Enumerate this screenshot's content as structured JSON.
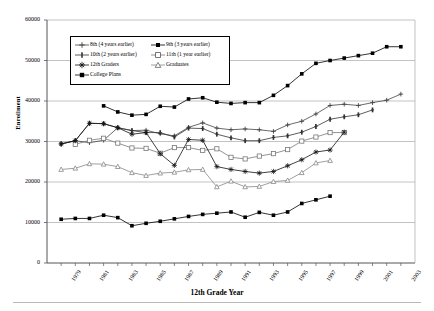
{
  "chart_data": {
    "type": "line",
    "title": "",
    "xlabel": "12th Grade Year",
    "ylabel": "Enrollment",
    "xlim": [
      1978,
      2004
    ],
    "ylim": [
      0,
      60000
    ],
    "ytick_labels": [
      "0",
      "10000",
      "20000",
      "30000",
      "40000",
      "50000",
      "60000"
    ],
    "ytick_values": [
      0,
      10000,
      20000,
      30000,
      40000,
      50000,
      60000
    ],
    "xtick_labels": [
      "1979",
      "1981",
      "1983",
      "1985",
      "1987",
      "1989",
      "1991",
      "1993",
      "1995",
      "1997",
      "1999",
      "2001",
      "2003"
    ],
    "xtick_values": [
      1979,
      1981,
      1983,
      1985,
      1987,
      1989,
      1991,
      1993,
      1995,
      1997,
      1999,
      2001,
      2003
    ],
    "grid": "horizontal",
    "legend_position": "upper-left-inside",
    "series": [
      {
        "name": "8th (4 years earlier)",
        "marker": "plus",
        "color": "#444444",
        "x": [
          1979,
          1980,
          1981,
          1982,
          1983,
          1984,
          1985,
          1986,
          1987,
          1988,
          1989,
          1990,
          1991,
          1992,
          1993,
          1994,
          1995,
          1996,
          1997,
          1998,
          1999,
          2000,
          2001,
          2002,
          2003
        ],
        "y": [
          29400,
          30200,
          29700,
          30300,
          33400,
          32700,
          32800,
          31900,
          31400,
          33500,
          34600,
          33300,
          32900,
          33100,
          32900,
          32500,
          34100,
          35000,
          36800,
          38900,
          39200,
          38900,
          39600,
          40200,
          41700
        ]
      },
      {
        "name": "9th (3 years earlier)",
        "marker": "square-filled",
        "color": "#000000",
        "x": [
          1982,
          1983,
          1984,
          1985,
          1986,
          1987,
          1988,
          1989,
          1990,
          1991,
          1992,
          1993,
          1994,
          1995,
          1996,
          1997,
          1998,
          1999,
          2000,
          2001,
          2002,
          2003
        ],
        "y": [
          38800,
          37300,
          36500,
          36700,
          38700,
          38500,
          40500,
          40800,
          39700,
          39400,
          39600,
          39600,
          41400,
          43800,
          46700,
          49300,
          50000,
          50600,
          51200,
          51800,
          53400,
          53400
        ]
      },
      {
        "name": "10th (2 years earlier)",
        "marker": "plus-bar",
        "color": "#333333",
        "x": [
          1979,
          1980,
          1981,
          1982,
          1983,
          1984,
          1985,
          1986,
          1987,
          1988,
          1989,
          1990,
          1991,
          1992,
          1993,
          1994,
          1995,
          1996,
          1997,
          1998,
          1999,
          2000,
          2001
        ],
        "y": [
          29400,
          30200,
          34500,
          34400,
          33400,
          32700,
          32200,
          32200,
          31100,
          33300,
          33200,
          31800,
          30900,
          30200,
          30200,
          31000,
          31400,
          32300,
          33700,
          35500,
          36100,
          36600,
          37800
        ]
      },
      {
        "name": "11th (1 year earlier)",
        "marker": "square-open",
        "color": "#777777",
        "x": [
          1980,
          1981,
          1982,
          1983,
          1984,
          1985,
          1986,
          1987,
          1988,
          1989,
          1990,
          1991,
          1992,
          1993,
          1994,
          1995,
          1996,
          1997,
          1998,
          1999
        ],
        "y": [
          29300,
          30300,
          30800,
          29600,
          28400,
          28300,
          27100,
          28500,
          28500,
          27800,
          28200,
          26100,
          25700,
          26400,
          27000,
          28000,
          30100,
          31100,
          32200,
          32200
        ]
      },
      {
        "name": "12th Graders",
        "marker": "star",
        "color": "#111111",
        "x": [
          1979,
          1980,
          1981,
          1982,
          1983,
          1984,
          1985,
          1986,
          1987,
          1988,
          1989,
          1990,
          1991,
          1992,
          1993,
          1994,
          1995,
          1996,
          1997,
          1998,
          1999
        ],
        "y": [
          29400,
          30200,
          34500,
          34400,
          33400,
          31800,
          32200,
          27000,
          24100,
          30500,
          30300,
          23800,
          23100,
          22600,
          22200,
          22600,
          24000,
          25500,
          27400,
          27900,
          32300
        ]
      },
      {
        "name": "Graduates",
        "marker": "triangle-open",
        "color": "#888888",
        "x": [
          1979,
          1980,
          1981,
          1982,
          1983,
          1984,
          1985,
          1986,
          1987,
          1988,
          1989,
          1990,
          1991,
          1992,
          1993,
          1994,
          1995,
          1996,
          1997,
          1998
        ],
        "y": [
          23100,
          23400,
          24500,
          24400,
          23800,
          22300,
          21600,
          22200,
          22400,
          23000,
          23100,
          18800,
          20200,
          18800,
          18900,
          20100,
          20400,
          22300,
          24700,
          25300
        ]
      },
      {
        "name": "College Plans",
        "marker": "square-filled",
        "color": "#000000",
        "x": [
          1979,
          1980,
          1981,
          1982,
          1983,
          1984,
          1985,
          1986,
          1987,
          1988,
          1989,
          1990,
          1991,
          1992,
          1993,
          1994,
          1995,
          1996,
          1997,
          1998
        ],
        "y": [
          10800,
          11000,
          11000,
          11800,
          11200,
          9200,
          9800,
          10300,
          10900,
          11500,
          12000,
          12300,
          12600,
          11300,
          12500,
          11800,
          12600,
          14700,
          15600,
          16500
        ]
      }
    ]
  }
}
